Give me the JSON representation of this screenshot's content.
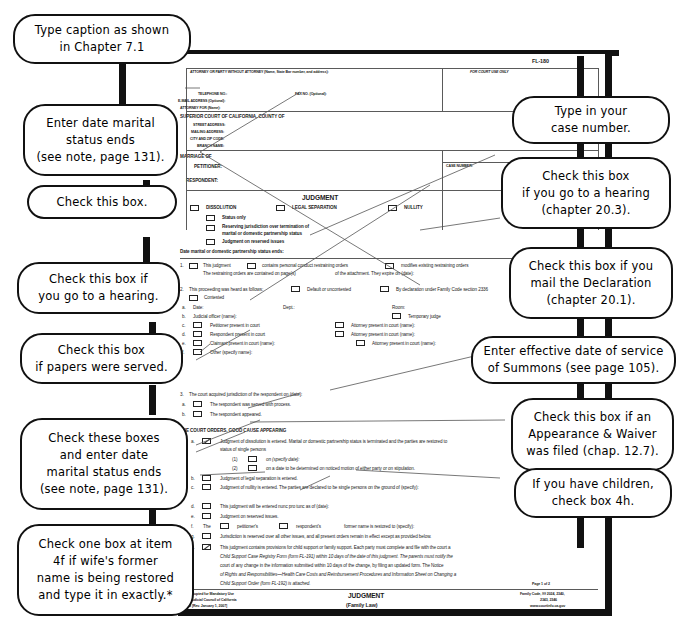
{
  "document": {
    "form_number": "FL-180",
    "title": "JUDGMENT",
    "subtitle": "(Family Law)",
    "page_label": "Page 1 of 2",
    "for_court_use": "FOR COURT USE ONLY",
    "attorney_header": "ATTORNEY OR PARTY WITHOUT ATTORNEY  (Name, State Bar number, and address):",
    "fields": {
      "telephone": "TELEPHONE NO.:",
      "fax": "FAX NO. (Optional):",
      "email": "E-MAIL ADDRESS (Optional):",
      "attorney_for": "ATTORNEY FOR (Name):",
      "court": "SUPERIOR COURT OF CALIFORNIA, COUNTY OF",
      "street": "STREET ADDRESS:",
      "mailing": "MAILING ADDRESS:",
      "city_zip": "CITY AND ZIP CODE:",
      "branch": "BRANCH NAME:",
      "marriage_of": "MARRIAGE OF",
      "petitioner": "PETITIONER:",
      "respondent": "RESPONDENT:",
      "case_number": "CASE NUMBER:"
    },
    "judgment_types": {
      "heading": "JUDGMENT",
      "dissolution": "DISSOLUTION",
      "legal_separation": "LEGAL SEPARATION",
      "nullity": "NULLITY",
      "status_only": "Status only",
      "reserving_line1": "Reserving jurisdiction over termination of",
      "reserving_line2": "marital or domestic partnership status",
      "reserved_issues": "Judgment on reserved issues",
      "date_status_ends": "Date marital or domestic partnership status ends:"
    },
    "item1": {
      "num": "1.",
      "a": "This judgment",
      "b": "contains personal conduct restraining orders",
      "c": "modifies existing restraining orders",
      "line2a": "The restraining orders are contained on page(s)",
      "line2b": "of the attachment.  They expire on (date):"
    },
    "item2": {
      "num": "2.",
      "lead": "This proceeding was heard as follows:",
      "default": "Default or uncontested",
      "declaration": "By declaration under Family Code section 2336",
      "contested": "Contested",
      "rows": [
        {
          "letter": "a.",
          "label": "Date:",
          "mid": "Dept.:",
          "right": "Room:"
        },
        {
          "letter": "b.",
          "label": "Judicial officer (name):",
          "mid": "",
          "right": "Temporary judge"
        },
        {
          "letter": "c.",
          "label": "Petitioner present in court",
          "mid": "",
          "right": "Attorney present in court (name):"
        },
        {
          "letter": "d.",
          "label": "Respondent present in court",
          "mid": "",
          "right": "Attorney present in court (name):"
        },
        {
          "letter": "e.",
          "label": "Claimant present in court (name):",
          "mid": "",
          "right": "Attorney present in court (name):"
        },
        {
          "letter": "f.",
          "label": "Other (specify name):",
          "mid": "",
          "right": ""
        }
      ]
    },
    "item3": {
      "num": "3.",
      "lead": "The court acquired jurisdiction of the respondent on (date):",
      "a": "The respondent was served with process.",
      "b": "The respondent appeared."
    },
    "orders": {
      "heading": "THE COURT ORDERS, GOOD CAUSE APPEARING",
      "num": "4.",
      "a_text1": "Judgment of dissolution is entered. Marital or domestic partnership status is terminated and the parties are restored to",
      "a_text2": "status of single persons",
      "a1": "on (specify date):",
      "a2": "on a date to be determined on noticed motion of either party or on stipulation.",
      "b": "Judgment of legal separation is entered.",
      "c": "Judgment of nullity is entered. The parties are declared to be single persons on the ground of (specify):",
      "d": "This judgment will be entered nunc pro tunc as of (date):",
      "e": "Judgment on reserved issues.",
      "f_pre": "The",
      "f_pet": "petitioner's",
      "f_res": "respondent's",
      "f_post": "former name is restored to (specify):",
      "g": "Jurisdiction is reserved over all other issues, and all present orders remain in effect except as provided below.",
      "h_l1": "This judgment contains provisions for child support or family support. Each party must complete and file with the court a",
      "h_l2": "Child Support Case Registry Form (form FL-191) within 10 days of the date of this judgment. The parents must notify the",
      "h_l3": "court of any change in the information submitted within 10 days of the change, by filing an updated form. The Notice",
      "h_l4": "of Rights and Responsibilities—Health Care Costs and Reimbursement Procedures and Information Sheet on Changing a",
      "h_l5": "Child Support Order (form FL-192) is attached."
    },
    "footer": {
      "left_l1": "Form Adopted for Mandatory Use",
      "left_l2": "Judicial Council of California",
      "left_l3": "FL-180 [Rev. January 1, 2007]",
      "right_l1": "Family Code, §§ 2024, 2340,",
      "right_l2": "2343, 2346",
      "right_l3": "www.courtinfo.ca.gov"
    }
  },
  "callouts": {
    "left": [
      {
        "id": "caption",
        "lines": [
          "Type caption as shown",
          "in Chapter 7.1"
        ]
      },
      {
        "id": "date-marital-ends",
        "lines": [
          "Enter date marital",
          "status ends",
          "(see note, page 131)."
        ]
      },
      {
        "id": "check-this-box",
        "lines": [
          "Check this box."
        ]
      },
      {
        "id": "hearing-box",
        "lines": [
          "Check this box if",
          "you go to a hearing."
        ]
      },
      {
        "id": "papers-served",
        "lines": [
          "Check this box",
          "if papers were served."
        ]
      },
      {
        "id": "check-these-boxes",
        "lines": [
          "Check these boxes",
          "and enter date",
          "marital status ends",
          "(see note, page 131)."
        ]
      },
      {
        "id": "former-name",
        "lines": [
          "Check one box at item",
          "4f if wife's former",
          "name is being restored",
          "and type it in exactly.*"
        ]
      }
    ],
    "right": [
      {
        "id": "case-number",
        "lines": [
          "Type in your",
          "case number."
        ]
      },
      {
        "id": "hearing-box-203",
        "lines": [
          "Check this box",
          "if you go to a hearing",
          "(chapter 20.3)."
        ]
      },
      {
        "id": "mail-declaration",
        "lines": [
          "Check this box if you",
          "mail the Declaration",
          "(chapter 20.1)."
        ]
      },
      {
        "id": "service-of-summons",
        "lines": [
          "Enter effective date of service",
          "of Summons (see page 105)."
        ]
      },
      {
        "id": "appearance-waiver",
        "lines": [
          "Check this box if an",
          "Appearance & Waiver",
          "was filed (chap. 12.7)."
        ]
      },
      {
        "id": "children-box-4h",
        "lines": [
          "If you have children,",
          "check box 4h."
        ]
      }
    ]
  },
  "colors": {
    "ink": "#111111",
    "form_text": "#1b1b1b",
    "rule": "#5a5a5a",
    "background": "#ffffff"
  }
}
